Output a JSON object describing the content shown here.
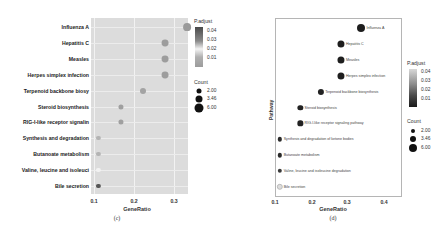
{
  "chart_data": [
    {
      "panel": "(c)",
      "type": "scatter",
      "subtype": "dot plot",
      "title": "",
      "xlabel": "GeneRatio",
      "ylabel": "",
      "x_ticks": [
        "0.1",
        "0.2",
        "0.3"
      ],
      "xlim": [
        0.1,
        0.335
      ],
      "grid": true,
      "background": "#dcdcdc",
      "categories": [
        "Influenza A",
        "Hepatitis C",
        "Measles",
        "Herpes simplex infection",
        "Terpenoid backbone biosy",
        "Steroid biosynthesis",
        "RIG-I-like receptor signalin",
        "Synthesis and degradation",
        "Butanoate metabolism",
        "Valine, leucine and isoleuci",
        "Bile secretion"
      ],
      "gene_ratio": [
        0.333,
        0.278,
        0.278,
        0.278,
        0.222,
        0.167,
        0.167,
        0.111,
        0.111,
        0.111,
        0.111
      ],
      "count": [
        6,
        5,
        5,
        5,
        4,
        3,
        3,
        2,
        2,
        2,
        2
      ],
      "p_adjust": [
        0.03,
        0.028,
        0.028,
        0.028,
        0.026,
        0.03,
        0.03,
        0.028,
        0.028,
        0.005,
        0.045
      ],
      "dot_colors": [
        "#9a9a9a",
        "#9d9d9d",
        "#9d9d9d",
        "#9d9d9d",
        "#a3a3a3",
        "#9f9f9f",
        "#a0a0a0",
        "#b4b4b4",
        "#b4b4b4",
        "#f2f2f2",
        "#555555"
      ],
      "legend": {
        "color_title": "P.adjust",
        "color_ticks": [
          "0.04",
          "0.03",
          "0.02",
          "0.01"
        ],
        "size_title": "Count",
        "size_ticks": [
          "2.00",
          "3.46",
          "6.00"
        ],
        "position": "right"
      }
    },
    {
      "panel": "(d)",
      "type": "scatter",
      "subtype": "dot plot with inline labels",
      "title": "",
      "xlabel": "GeneRatio",
      "ylabel": "Pathway",
      "x_ticks": [
        "0.1",
        "0.2",
        "0.3",
        "0.4"
      ],
      "xlim": [
        0.1,
        0.45
      ],
      "grid": false,
      "background": "#ffffff",
      "categories": [
        "Influenza A",
        "Hepatitis C",
        "Measles",
        "Herpes simplex infection",
        "Terpenoid backbone biosynthesis",
        "Steroid biosynthesis",
        "RIG-I-like receptor signaling pathway",
        "Synthesis and degradation of ketone bodies",
        "Butanoate metabolism",
        "Valine, leucine and isoleucine degradation",
        "Bile secretion"
      ],
      "gene_ratio": [
        0.333,
        0.278,
        0.278,
        0.278,
        0.222,
        0.167,
        0.167,
        0.111,
        0.111,
        0.111,
        0.111
      ],
      "count": [
        6,
        5,
        5,
        5,
        4,
        3,
        3,
        2,
        2,
        2,
        2
      ],
      "dot_colors": [
        "#1e1e1e",
        "#1e1e1e",
        "#1e1e1e",
        "#1e1e1e",
        "#222222",
        "#222222",
        "#222222",
        "#2a2a2a",
        "#2a2a2a",
        "#3a3a3a",
        "#dddddd"
      ],
      "legend": {
        "color_title": "P.adjust",
        "color_ticks": [
          "0.04",
          "0.03",
          "0.02",
          "0.01"
        ],
        "size_title": "Count",
        "size_ticks": [
          "2.00",
          "3.46",
          "6.00"
        ],
        "position": "right"
      }
    }
  ],
  "captions": {
    "c": "(c)",
    "d": "(d)"
  }
}
